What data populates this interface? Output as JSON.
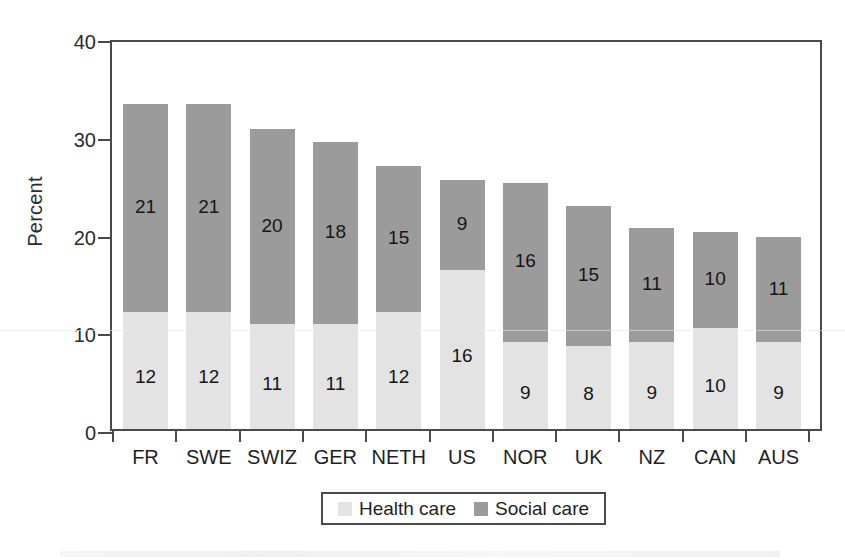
{
  "chart_data": {
    "type": "bar",
    "subtype": "stacked-bar",
    "title": "",
    "xlabel": "",
    "ylabel": "Percent",
    "ylim": [
      0,
      40
    ],
    "yticks": [
      0,
      10,
      20,
      30,
      40
    ],
    "grid": false,
    "legend_position": "bottom-center",
    "categories": [
      "FR",
      "SWE",
      "SWIZ",
      "GER",
      "NETH",
      "US",
      "NOR",
      "UK",
      "NZ",
      "CAN",
      "AUS"
    ],
    "series": [
      {
        "name": "Health care",
        "color": "#e3e3e3",
        "values": [
          12,
          12,
          11,
          11,
          12,
          16,
          9,
          8,
          9,
          10,
          9
        ]
      },
      {
        "name": "Social care",
        "color": "#9b9b9b",
        "values": [
          21,
          21,
          20,
          18,
          15,
          9,
          16,
          15,
          11,
          10,
          11
        ]
      }
    ],
    "bar_totals": [
      33.2,
      33.2,
      30.7,
      29.4,
      26.9,
      25.5,
      25.2,
      22.8,
      20.6,
      20.2,
      19.6
    ],
    "health_tops": [
      12.0,
      12.0,
      10.7,
      10.7,
      12.0,
      16.3,
      8.9,
      8.5,
      8.9,
      10.3,
      8.9
    ]
  },
  "axes": {
    "y_title": "Percent",
    "y_tick_labels": [
      "40",
      "30",
      "20",
      "10",
      "0"
    ],
    "x_tick_labels": [
      "FR",
      "SWE",
      "SWIZ",
      "GER",
      "NETH",
      "US",
      "NOR",
      "UK",
      "NZ",
      "CAN",
      "AUS"
    ]
  },
  "legend": {
    "items": [
      {
        "label": "Health care",
        "color": "#e3e3e3"
      },
      {
        "label": "Social care",
        "color": "#9b9b9b"
      }
    ]
  },
  "bar_labels": {
    "health": [
      "12",
      "12",
      "11",
      "11",
      "12",
      "16",
      "9",
      "8",
      "9",
      "10",
      "9"
    ],
    "social": [
      "21",
      "21",
      "20",
      "18",
      "15",
      "9",
      "16",
      "15",
      "11",
      "10",
      "11"
    ]
  },
  "colors": {
    "health_care": "#e3e3e3",
    "social_care": "#9b9b9b",
    "axis": "#4a4a4a",
    "text": "#1a1a1a",
    "background": "#ffffff"
  }
}
